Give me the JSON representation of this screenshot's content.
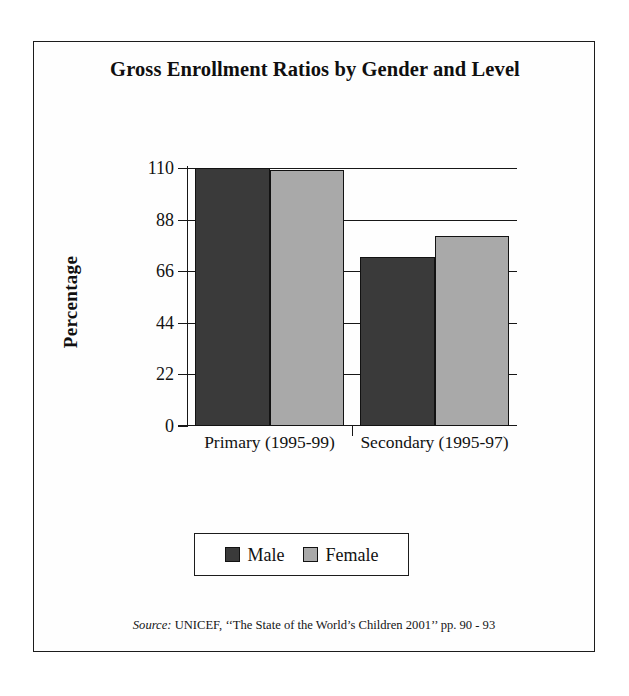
{
  "chart_data": {
    "type": "bar",
    "title": "Gross Enrollment Ratios by Gender and Level",
    "xlabel": "",
    "ylabel": "Percentage",
    "categories": [
      "Primary (1995-99)",
      "Secondary (1995-97)"
    ],
    "series": [
      {
        "name": "Male",
        "values": [
          110,
          72
        ]
      },
      {
        "name": "Female",
        "values": [
          109,
          81
        ]
      }
    ],
    "ylim": [
      0,
      110
    ],
    "yticks": [
      0,
      22,
      44,
      66,
      88,
      110
    ],
    "ytick_labels": [
      "0",
      "22",
      "44",
      "66",
      "88",
      "110"
    ],
    "grid": true,
    "legend_position": "bottom",
    "colors": {
      "male": "#3a3a3a",
      "female": "#a9a9a9",
      "axis": "#171717",
      "frame": "#1c1c1c",
      "background": "#ffffff"
    }
  },
  "legend": {
    "entries": [
      {
        "label": "Male",
        "swatch": "male"
      },
      {
        "label": "Female",
        "swatch": "female"
      }
    ]
  },
  "source": {
    "keyword": "Source:",
    "text": " UNICEF, ‘‘The State of the World’s Children 2001’’ pp. 90 - 93"
  }
}
